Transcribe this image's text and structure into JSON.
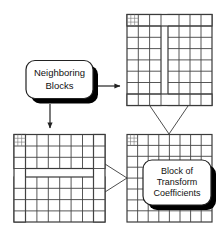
{
  "figure": {
    "background_color": "#ffffff",
    "line_color": "#3a3a3a",
    "text_color": "#111111",
    "shadow_color": "#000000"
  },
  "callouts": {
    "neighboring": {
      "name": "neighboring-blocks-callout",
      "line1": "Neighboring",
      "line2": "Blocks"
    },
    "transform": {
      "name": "block-of-transform-coefficients-callout",
      "line1": "Block of",
      "line2": "Transform",
      "line3": "Coefficients"
    }
  },
  "blocks": {
    "top_right": {
      "name": "neighboring-block-column",
      "rows": 8,
      "cols": 8,
      "gap_orientation": "vertical",
      "has_corner_subgrid": true,
      "corner_subgrid_divisions": 3
    },
    "bottom_left": {
      "name": "neighboring-block-row",
      "rows": 8,
      "cols": 8,
      "gap_orientation": "horizontal",
      "has_corner_subgrid": true,
      "corner_subgrid_divisions": 3
    },
    "bottom_right": {
      "name": "transform-coefficient-block",
      "rows": 8,
      "cols": 8,
      "gap_orientation": "none",
      "has_corner_subgrid": true,
      "corner_subgrid_divisions": 3
    }
  },
  "arrows": [
    {
      "name": "arrow-neighboring-to-top-right",
      "direction": "right"
    },
    {
      "name": "arrow-neighboring-to-bottom-left",
      "direction": "down"
    }
  ],
  "connectors": [
    {
      "name": "connector-column-to-block",
      "shape": "v-down"
    },
    {
      "name": "connector-row-to-block",
      "shape": "v-right"
    }
  ]
}
